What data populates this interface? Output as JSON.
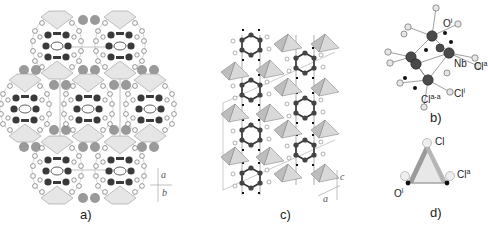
{
  "figure": {
    "panels": [
      {
        "id": "a",
        "label": "a)",
        "axes": [
          "a",
          "b"
        ]
      },
      {
        "id": "b",
        "label": "b)",
        "atoms": [
          {
            "name": "O",
            "sup": "i"
          },
          {
            "name": "Nb",
            "sup": ""
          },
          {
            "name": "Cl",
            "sup": "a"
          },
          {
            "name": "Cl",
            "sup": "i"
          },
          {
            "name": "Cl",
            "sup": "a-a"
          }
        ]
      },
      {
        "id": "c",
        "label": "c)",
        "axes": [
          "c",
          "a"
        ]
      },
      {
        "id": "d",
        "label": "d)",
        "atoms": [
          {
            "name": "Cl",
            "sup": ""
          },
          {
            "name": "Cl",
            "sup": "a"
          },
          {
            "name": "O",
            "sup": "i"
          }
        ]
      }
    ]
  },
  "colors": {
    "cluster_dark": "#3a3a3a",
    "cation_grey": "#9a9a9a",
    "ligand_light": "#e8e8e8",
    "polyhedron": "#cfcfcf",
    "cell_line": "#b0b0b0"
  }
}
